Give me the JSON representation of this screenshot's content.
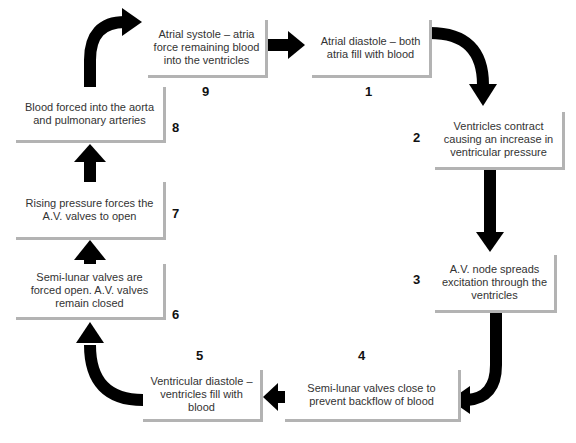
{
  "diagram": {
    "type": "cycle",
    "steps": [
      {
        "number": "1",
        "text": "Atrial diastole – both atria fill with blood"
      },
      {
        "number": "2",
        "text": "Ventricles contract causing an increase in ventricular pressure"
      },
      {
        "number": "3",
        "text": "A.V. node spreads excitation through the ventricles"
      },
      {
        "number": "4",
        "text": "Semi-lunar valves close to prevent backflow of blood"
      },
      {
        "number": "5",
        "text": "Ventricular diastole – ventricles fill with blood"
      },
      {
        "number": "6",
        "text": "Semi-lunar valves are forced open. A.V. valves remain closed"
      },
      {
        "number": "7",
        "text": "Rising pressure forces the A.V. valves to open"
      },
      {
        "number": "8",
        "text": "Blood forced into the aorta and pulmonary arteries"
      },
      {
        "number": "9",
        "text": "Atrial systole – atria force remaining blood into the ventricles"
      }
    ],
    "flow": [
      "1→2",
      "2→3",
      "3→4",
      "4→5",
      "5→6",
      "6→7",
      "7→8",
      "8→9",
      "9→1"
    ],
    "colors": {
      "arrow": "#000000",
      "box_shadow": "#b3b3b3",
      "text": "#333333"
    }
  }
}
